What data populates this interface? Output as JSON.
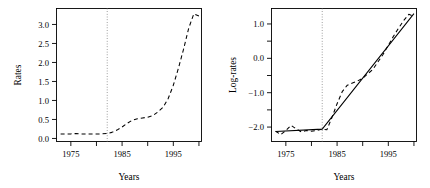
{
  "figure": {
    "background": "#ffffff",
    "ink": "#000000",
    "panel_count": 2
  },
  "chart_data": [
    {
      "id": "rates-panel",
      "type": "line",
      "title": "",
      "xlabel": "Years",
      "ylabel": "Rates",
      "xlim": [
        1972.2,
        2000.5
      ],
      "ylim": [
        -0.08,
        3.42
      ],
      "grid": false,
      "legend": null,
      "xticks": [
        1975,
        1980,
        1985,
        1990,
        1995,
        2000
      ],
      "xticklabels": [
        "1975",
        "",
        "1985",
        "",
        "1995",
        ""
      ],
      "yticks": [
        0.0,
        0.5,
        1.0,
        1.5,
        2.0,
        2.5,
        3.0
      ],
      "yticklabels": [
        "0.0",
        "0.5",
        "1.0",
        "1.5",
        "2.0",
        "2.5",
        "3.0"
      ],
      "annotations": [
        {
          "name": "breakpoint-line",
          "type": "vline",
          "x": 1982.1,
          "style": "dotted"
        }
      ],
      "series": [
        {
          "name": "observed-rates",
          "style": "dashed",
          "color": "#000000",
          "x": [
            1973,
            1974,
            1975,
            1976,
            1977,
            1978,
            1979,
            1980,
            1981,
            1982,
            1983,
            1984,
            1985,
            1986,
            1987,
            1988,
            1989,
            1990,
            1991,
            1992,
            1993,
            1994,
            1995,
            1996,
            1997,
            1998,
            1999,
            2000
          ],
          "y": [
            0.12,
            0.12,
            0.12,
            0.13,
            0.12,
            0.12,
            0.12,
            0.12,
            0.12,
            0.13,
            0.16,
            0.22,
            0.3,
            0.4,
            0.48,
            0.52,
            0.54,
            0.56,
            0.6,
            0.7,
            0.82,
            1.05,
            1.4,
            1.85,
            2.35,
            2.9,
            3.28,
            3.22
          ]
        }
      ]
    },
    {
      "id": "log-rates-panel",
      "type": "line",
      "title": "",
      "xlabel": "Years",
      "ylabel": "Log-rates",
      "xlim": [
        1972.2,
        2000.5
      ],
      "ylim": [
        -2.42,
        1.45
      ],
      "grid": false,
      "legend": null,
      "xticks": [
        1975,
        1980,
        1985,
        1990,
        1995,
        2000
      ],
      "xticklabels": [
        "1975",
        "",
        "1985",
        "",
        "1995",
        ""
      ],
      "yticks": [
        -2.0,
        -1.5,
        -1.0,
        -0.5,
        0.0,
        0.5,
        1.0
      ],
      "yticklabels": [
        "-2.0",
        "",
        "-1.0",
        "",
        "0.0",
        "",
        "1.0"
      ],
      "annotations": [
        {
          "name": "breakpoint-line",
          "type": "vline",
          "x": 1982.1,
          "style": "dotted"
        }
      ],
      "series": [
        {
          "name": "observed-log-rates",
          "style": "dashed",
          "color": "#000000",
          "x": [
            1973,
            1974,
            1975,
            1976,
            1977,
            1978,
            1979,
            1980,
            1981,
            1982,
            1983,
            1984,
            1985,
            1986,
            1987,
            1988,
            1989,
            1990,
            1991,
            1992,
            1993,
            1994,
            1995,
            1996,
            1997,
            1998,
            1999,
            2000
          ],
          "y": [
            -2.12,
            -2.22,
            -2.1,
            -1.95,
            -2.05,
            -2.14,
            -2.1,
            -2.12,
            -2.1,
            -2.06,
            -2.08,
            -1.72,
            -1.32,
            -0.97,
            -0.78,
            -0.72,
            -0.66,
            -0.58,
            -0.45,
            -0.32,
            -0.1,
            0.12,
            0.38,
            0.64,
            0.88,
            1.1,
            1.28,
            1.22
          ]
        },
        {
          "name": "segmented-fit",
          "style": "solid",
          "color": "#000000",
          "x": [
            1973,
            1982.1,
            2000
          ],
          "y": [
            -2.13,
            -2.06,
            1.3
          ]
        }
      ]
    }
  ]
}
